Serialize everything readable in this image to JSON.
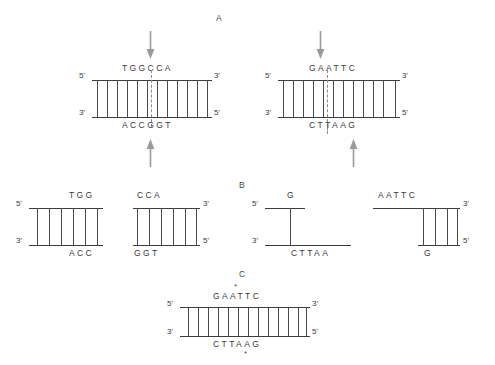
{
  "figure": {
    "sections": {
      "a": "A",
      "b": "B",
      "c": "C"
    },
    "colors": {
      "strand": "#3c3c3c",
      "rung": "#4a4a4a",
      "cut_dashed": "#8a8a8a",
      "arrow": "#9a9a9a",
      "text": "#3a3a3a",
      "background": "#ffffff"
    }
  },
  "labels": {
    "five_prime": "5'",
    "three_prime": "3'",
    "asterisk": "*"
  },
  "panel_a": {
    "left_duplex": {
      "name": "blunt-cutter-duplex",
      "top_sequence": "TGGCCA",
      "bottom_sequence": "ACCGGT",
      "top_left_end": "5'",
      "top_right_end": "3'",
      "bottom_left_end": "3'",
      "bottom_right_end": "5'",
      "base_pair_count": 12,
      "cut_position_top": "between G and C",
      "cut_position_bottom": "between C and G",
      "top_arrow": "down-arrow",
      "bottom_arrow": "up-arrow"
    },
    "right_duplex": {
      "name": "sticky-cutter-duplex",
      "top_sequence": "GAATTC",
      "bottom_sequence": "CTTAAG",
      "top_left_end": "5'",
      "top_right_end": "3'",
      "bottom_left_end": "3'",
      "bottom_right_end": "5'",
      "base_pair_count": 12,
      "cut_position_top": "between G and A",
      "cut_position_bottom": "between A and G",
      "top_arrow": "down-arrow",
      "bottom_arrow": "up-arrow"
    }
  },
  "panel_b": {
    "fragments": [
      {
        "name": "blunt-fragment-left",
        "top_sequence": "TGG",
        "bottom_sequence": "ACC",
        "left_top_end": "5'",
        "left_bottom_end": "3'",
        "right_top_end": "",
        "right_bottom_end": "",
        "base_pair_count": 6,
        "end_type": "blunt"
      },
      {
        "name": "blunt-fragment-right",
        "top_sequence": "CCA",
        "bottom_sequence": "GGT",
        "left_top_end": "",
        "left_bottom_end": "",
        "right_top_end": "3'",
        "right_bottom_end": "5'",
        "base_pair_count": 6,
        "end_type": "blunt"
      },
      {
        "name": "sticky-fragment-left",
        "top_sequence": "G",
        "bottom_sequence": "CTTAA",
        "left_top_end": "5'",
        "left_bottom_end": "3'",
        "right_top_end": "",
        "right_bottom_end": "",
        "base_pair_count": 1,
        "end_type": "5-prime-overhang"
      },
      {
        "name": "sticky-fragment-right",
        "top_sequence": "AATTC",
        "bottom_sequence": "G",
        "left_top_end": "",
        "left_bottom_end": "",
        "right_top_end": "3'",
        "right_bottom_end": "5'",
        "base_pair_count": 4,
        "end_type": "5-prime-overhang"
      }
    ]
  },
  "panel_c": {
    "ligated_duplex": {
      "name": "ligated-duplex",
      "top_sequence": "GAATTC",
      "bottom_sequence": "CTTAAG",
      "top_left_end": "5'",
      "top_right_end": "3'",
      "bottom_left_end": "3'",
      "bottom_right_end": "5'",
      "base_pair_count": 13,
      "top_asterisk_over": "A",
      "bottom_asterisk_under": "A"
    }
  }
}
